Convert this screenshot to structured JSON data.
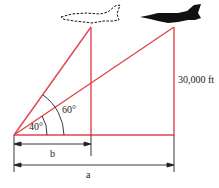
{
  "diagram": {
    "labels": {
      "height": "30,000 ft",
      "angle_small": "40°",
      "angle_large": "60°",
      "dim_b": "b",
      "dim_a": "a"
    },
    "colors": {
      "triangle_lines": "#e0454f",
      "dimension_lines": "#222222",
      "jet": "#111111"
    },
    "jets": [
      {
        "name": "earlier-position",
        "style": "dashed-outline"
      },
      {
        "name": "later-position",
        "style": "solid-silhouette"
      }
    ]
  }
}
